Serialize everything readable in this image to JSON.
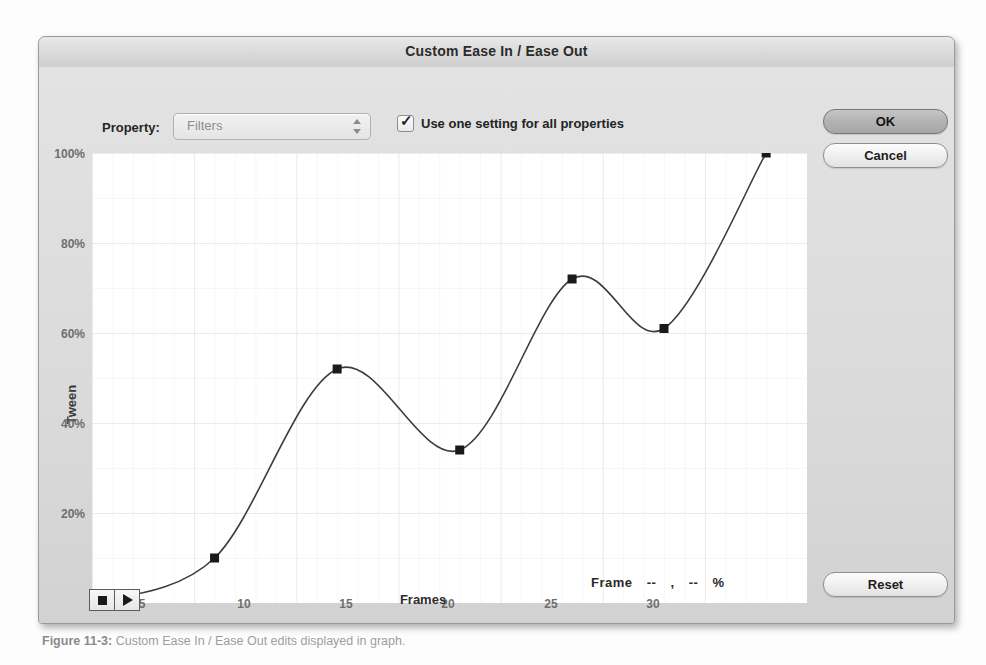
{
  "dialog": {
    "title": "Custom Ease In / Ease Out",
    "property_label": "Property:",
    "property_value": "Filters",
    "checkbox_label": "Use one setting for all properties",
    "checkbox_checked": "✓",
    "buttons": {
      "ok": "OK",
      "cancel": "Cancel",
      "reset": "Reset"
    },
    "transport": {
      "stop": "stop-button",
      "play": "play-button"
    },
    "readout": {
      "prefix": "Frame",
      "frame_value": "--",
      "comma": ",",
      "percent_value": "--",
      "percent_sign": "%"
    }
  },
  "caption": {
    "figure": "Figure 11-3:",
    "text": "Custom Ease In / Ease Out edits displayed in graph."
  },
  "chart_data": {
    "type": "line",
    "title": "",
    "xlabel": "Frames",
    "ylabel": "Tween",
    "xlim": [
      0,
      35
    ],
    "ylim": [
      0,
      100
    ],
    "grid": true,
    "legend": "none",
    "xticks": [
      5,
      10,
      15,
      20,
      25,
      30
    ],
    "yticks": [
      20,
      40,
      60,
      80,
      100
    ],
    "ytick_labels": [
      "20%",
      "40%",
      "60%",
      "80%",
      "100%"
    ],
    "x": [
      0,
      6,
      12,
      18,
      23.5,
      28,
      33
    ],
    "y": [
      0,
      10,
      52,
      34,
      72,
      61,
      100
    ],
    "control_points": [
      {
        "frame": 0,
        "tween": 0
      },
      {
        "frame": 6,
        "tween": 10
      },
      {
        "frame": 12,
        "tween": 52
      },
      {
        "frame": 18,
        "tween": 34
      },
      {
        "frame": 23.5,
        "tween": 72
      },
      {
        "frame": 28,
        "tween": 61
      },
      {
        "frame": 33,
        "tween": 100
      }
    ],
    "curve_path": "M 0,450 C 20,449 41,446 61,432 C 82,418 102,390 122,351 C 143,312 163,243 184,205 C 204,167 225,140 245,144 C 266,148 286,185 306,218 C 327,251 347,279 368,297 C 388,315 409,311 429,288 C 450,265 470,203 490,166 C 511,129 531,121 551,128 C 572,135 592,159 613,176 C 633,193 654,192 674,176 C 695,160 715,85 735,0",
    "marker_color": "#1a1a1a",
    "line_color": "#3d3d3d"
  }
}
